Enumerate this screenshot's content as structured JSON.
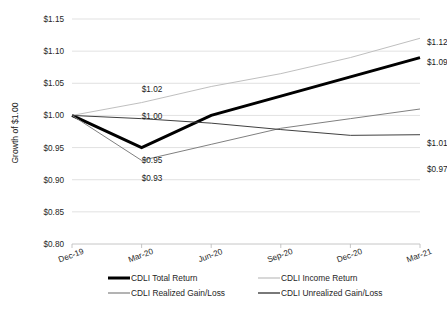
{
  "chart_data": {
    "type": "line",
    "title": "",
    "xlabel": "",
    "ylabel": "Growth of $1.00",
    "categories": [
      "Dec-19",
      "Mar-20",
      "Jun-20",
      "Sep-20",
      "Dec-20",
      "Mar-21"
    ],
    "ylim": [
      0.8,
      1.15
    ],
    "ytick_values": [
      0.8,
      0.85,
      0.9,
      0.95,
      1.0,
      1.05,
      1.1,
      1.15
    ],
    "ytick_labels": [
      "$0.80",
      "$0.85",
      "$0.90",
      "$0.95",
      "$1.00",
      "$1.05",
      "$1.10",
      "$1.15"
    ],
    "grid": true,
    "legend_position": "bottom",
    "series": [
      {
        "name": "CDLI Total Return",
        "color": "#000000",
        "width": 3.0,
        "values": [
          1.0,
          0.95,
          1.0,
          1.03,
          1.06,
          1.09
        ]
      },
      {
        "name": "CDLI Income Return",
        "color": "#bfbfbf",
        "width": 1.0,
        "values": [
          1.0,
          1.02,
          1.045,
          1.065,
          1.09,
          1.12
        ]
      },
      {
        "name": "CDLI Realized Gain/Loss",
        "color": "#808080",
        "width": 1.0,
        "values": [
          1.0,
          0.93,
          0.955,
          0.98,
          0.995,
          1.01
        ]
      },
      {
        "name": "CDLI Unrealized Gain/Loss",
        "color": "#404040",
        "width": 1.0,
        "values": [
          1.0,
          0.995,
          0.988,
          0.978,
          0.969,
          0.97
        ]
      }
    ],
    "data_labels": [
      {
        "text": "$1.02",
        "series": "CDLI Income Return",
        "category": "Mar-20",
        "x": 152,
        "y": 92
      },
      {
        "text": "$1.00",
        "series": "CDLI Unrealized Gain/Loss",
        "category": "Mar-20",
        "x": 152,
        "y": 119
      },
      {
        "text": "$0.95",
        "series": "CDLI Total Return",
        "category": "Mar-20",
        "x": 152,
        "y": 163
      },
      {
        "text": "$0.93",
        "series": "CDLI Realized Gain/Loss",
        "category": "Mar-20",
        "x": 152,
        "y": 181
      },
      {
        "text": "$1.12",
        "series": "CDLI Income Return",
        "category": "Mar-21",
        "x": 427,
        "y": 45
      },
      {
        "text": "$1.09",
        "series": "CDLI Total Return",
        "category": "Mar-21",
        "x": 427,
        "y": 65
      },
      {
        "text": "$1.01",
        "series": "CDLI Realized Gain/Loss",
        "category": "Mar-21",
        "x": 427,
        "y": 146
      },
      {
        "text": "$0.97",
        "series": "CDLI Unrealized Gain/Loss",
        "category": "Mar-21",
        "x": 427,
        "y": 172
      }
    ],
    "legend": [
      {
        "label": "CDLI Total Return",
        "color": "#000000",
        "width": 3.0
      },
      {
        "label": "CDLI Income Return",
        "color": "#bfbfbf",
        "width": 1.2
      },
      {
        "label": "CDLI Realized Gain/Loss",
        "color": "#808080",
        "width": 1.2
      },
      {
        "label": "CDLI Unrealized Gain/Loss",
        "color": "#404040",
        "width": 1.4
      }
    ]
  }
}
